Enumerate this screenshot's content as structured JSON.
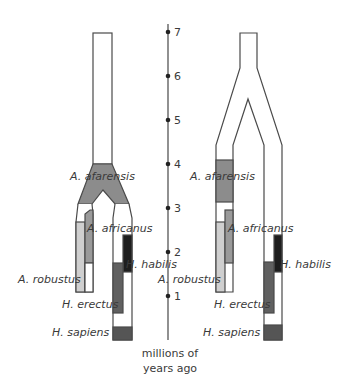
{
  "diagram": {
    "type": "phylogenetic-tree-comparison",
    "axis": {
      "label_line1": "millions of",
      "label_line2": "years ago",
      "ticks": [
        "7",
        "6",
        "5",
        "4",
        "3",
        "2",
        "1"
      ]
    },
    "left_tree": {
      "labels": {
        "afarensis": "A. afarensis",
        "africanus": "A. africanus",
        "robustus": "A. robustus",
        "habilis": "H. habilis",
        "erectus": "H. erectus",
        "sapiens": "H. sapiens"
      }
    },
    "right_tree": {
      "labels": {
        "afarensis": "A. afarensis",
        "africanus": "A. africanus",
        "robustus": "A. robustus",
        "habilis": "H. habilis",
        "erectus": "H. erectus",
        "sapiens": "H. sapiens"
      }
    },
    "colors": {
      "outline": "#4a4a4a",
      "afarensis": "#8c8c8c",
      "africanus": "#9a9a9a",
      "robustus": "#cfcfcf",
      "habilis": "#1e1e1e",
      "erectus": "#606060",
      "sapiens": "#555555"
    }
  }
}
